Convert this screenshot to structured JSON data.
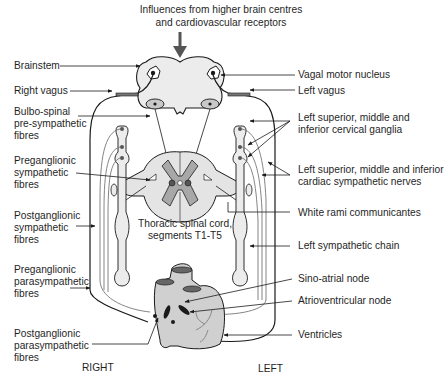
{
  "title": {
    "line1": "Influences from higher brain centres",
    "line2": "and cardiovascular receptors"
  },
  "labels_left": {
    "brainstem": "Brainstem",
    "right_vagus": "Right vagus",
    "bulbo_spinal": "Bulbo-spinal\npre-sympathetic\nfibres",
    "preganglionic_sympathetic": "Preganglionic\nsympathetic\nfibres",
    "postganglionic_sympathetic": "Postganglionic\nsympathetic\nfibres",
    "preganglionic_parasympathetic": "Preganglionic\nparasympathetic\nfibres",
    "postganglionic_parasympathetic": "Postganglionic\nparasympathetic\nfibres"
  },
  "labels_right": {
    "vagal_motor_nucleus": "Vagal motor nucleus",
    "left_vagus": "Left vagus",
    "cervical_ganglia": "Left superior, middle and\ninferior cervical ganglia",
    "cardiac_nerves": "Left superior, middle and inferior\ncardiac sympathetic nerves",
    "white_rami": "White rami communicantes",
    "sympathetic_chain": "Left sympathetic chain",
    "sino_atrial": "Sino-atrial node",
    "atrioventricular": "Atrioventricular node",
    "ventricles": "Ventricles"
  },
  "center": {
    "spinal_cord": "Thoracic spinal cord,\nsegments T1-T5"
  },
  "sides": {
    "right": "RIGHT",
    "left": "LEFT"
  },
  "colors": {
    "line": "#1a1a1a",
    "fill_gray": "#d9d9d9",
    "fill_light": "#ececec",
    "dark_gray": "#8a8a8a"
  }
}
